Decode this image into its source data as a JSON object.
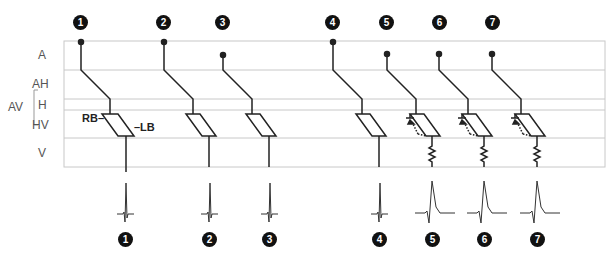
{
  "diagram": {
    "row_labels": {
      "A": "A",
      "AH": "AH",
      "H": "H",
      "HV": "HV",
      "V": "V",
      "AV": "AV"
    },
    "bundle_labels": {
      "rb": "RB–",
      "lb": "–LB"
    },
    "scenarios": [
      {
        "number": "1",
        "origin_row": "A",
        "block": "none",
        "qrs": "narrow"
      },
      {
        "number": "2",
        "origin_row": "A",
        "block": "none",
        "qrs": "narrow"
      },
      {
        "number": "3",
        "origin_row": "A-mid",
        "block": "none",
        "qrs": "narrow"
      },
      {
        "number": "4",
        "origin_row": "A",
        "block": "none",
        "qrs": "narrow"
      },
      {
        "number": "5",
        "origin_row": "A-mid",
        "block": "accessory-pathway",
        "qrs": "wide"
      },
      {
        "number": "6",
        "origin_row": "A-mid",
        "block": "accessory-pathway",
        "qrs": "wide"
      },
      {
        "number": "7",
        "origin_row": "A-mid",
        "block": "accessory-pathway",
        "qrs": "wide"
      }
    ],
    "colors": {
      "grid": "#c8c8c8",
      "line": "#222222",
      "badge": "#111111"
    }
  }
}
